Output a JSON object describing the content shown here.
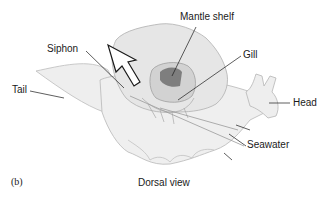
{
  "diagram": {
    "panel": "(b)",
    "caption": "Dorsal view",
    "labels": {
      "mantle_shelf": "Mantle shelf",
      "siphon": "Siphon",
      "gill": "Gill",
      "tail": "Tail",
      "head": "Head",
      "seawater": "Seawater"
    },
    "colors": {
      "body_fill": "#ececec",
      "body_outline": "#b5b5b5",
      "dark_cavity": "#7a7a7a",
      "leader_line": "#1a1a1a",
      "arrow_outline": "#1a1a1a"
    }
  }
}
